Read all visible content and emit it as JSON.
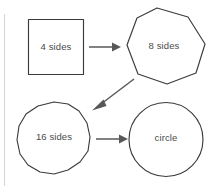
{
  "diagram": {
    "background_color": "#ffffff",
    "stroke_color": "#3b3b3b",
    "arrow_color": "#58585a",
    "text_color": "#4a4a4a",
    "margin_rule_color": "#d8d8d8",
    "nodes": [
      {
        "id": "square",
        "label": "4 sides",
        "shape": "square",
        "sides": 4,
        "center_x": 56,
        "center_y": 47,
        "label_x": 56,
        "label_y": 47
      },
      {
        "id": "octagon",
        "label": "8 sides",
        "shape": "octagon",
        "sides": 8,
        "center_x": 163,
        "center_y": 46,
        "label_x": 163,
        "label_y": 46
      },
      {
        "id": "hexadecagon",
        "label": "16 sides",
        "shape": "16-gon",
        "sides": 16,
        "center_x": 54,
        "center_y": 138,
        "label_x": 54,
        "label_y": 136
      },
      {
        "id": "circle",
        "label": "circle",
        "shape": "circle",
        "sides": 0,
        "center_x": 166,
        "center_y": 139,
        "label_x": 166,
        "label_y": 137
      }
    ],
    "arrows": [
      {
        "id": "square-to-octagon",
        "from": "square",
        "to": "octagon",
        "direction": "right",
        "x1": 89,
        "y1": 47,
        "x2": 119,
        "y2": 47
      },
      {
        "id": "octagon-to-16gon",
        "from": "octagon",
        "to": "hexadecagon",
        "direction": "down-left",
        "x1": 134,
        "y1": 79,
        "x2": 93,
        "y2": 110
      },
      {
        "id": "16gon-to-circle",
        "from": "hexadecagon",
        "to": "circle",
        "direction": "right",
        "x1": 96,
        "y1": 139,
        "x2": 126,
        "y2": 139
      }
    ]
  }
}
